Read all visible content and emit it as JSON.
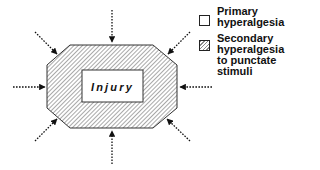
{
  "diagram": {
    "center_label": "Injury",
    "regions": [
      {
        "id": "primary",
        "label": "Injury",
        "fill": "plain",
        "color": "#ffffff"
      },
      {
        "id": "secondary",
        "fill": "diagonal-hatch",
        "color": "#8a8a8a"
      }
    ],
    "arrows": {
      "count": 8,
      "style": "dotted",
      "direction": "inward",
      "positions": [
        "top",
        "top-right",
        "right",
        "bottom-right",
        "bottom",
        "bottom-left",
        "left",
        "top-left"
      ]
    }
  },
  "legend": {
    "items": [
      {
        "swatch": "plain",
        "lines": [
          "Primary",
          "hyperalgesia"
        ]
      },
      {
        "swatch": "hatched",
        "lines": [
          "Secondary",
          "hyperalgesia",
          "to punctate",
          "stimuli"
        ]
      }
    ]
  }
}
